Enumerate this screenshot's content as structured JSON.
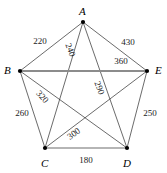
{
  "figure": {
    "type": "complete-graph-k5",
    "width": 167,
    "height": 173,
    "background_color": "#ffffff",
    "edge_color": "#2b2b2b",
    "highlight_edge_color": "#8c8c8c",
    "vertex_color": "#000000"
  },
  "vertices": [
    {
      "id": "A",
      "label": "A",
      "x": 83,
      "y": 22,
      "label_x": 79,
      "label_y": 6
    },
    {
      "id": "B",
      "label": "B",
      "x": 20,
      "y": 71,
      "label_x": 4,
      "label_y": 65
    },
    {
      "id": "C",
      "label": "C",
      "x": 45,
      "y": 148,
      "label_x": 41,
      "label_y": 158
    },
    {
      "id": "D",
      "label": "D",
      "x": 127,
      "y": 148,
      "label_x": 123,
      "label_y": 158
    },
    {
      "id": "E",
      "label": "E",
      "x": 147,
      "y": 71,
      "label_x": 155,
      "label_y": 65
    }
  ],
  "edges": [
    {
      "from": "A",
      "to": "B",
      "weight": "220",
      "kind": "perimeter",
      "label_x": 40,
      "label_y": 41,
      "rotation": 0
    },
    {
      "from": "A",
      "to": "E",
      "weight": "430",
      "kind": "perimeter",
      "label_x": 128,
      "label_y": 42,
      "rotation": 0
    },
    {
      "from": "B",
      "to": "C",
      "weight": "260",
      "kind": "perimeter",
      "label_x": 22,
      "label_y": 113,
      "rotation": 0
    },
    {
      "from": "D",
      "to": "E",
      "weight": "250",
      "kind": "perimeter",
      "label_x": 150,
      "label_y": 113,
      "rotation": 0
    },
    {
      "from": "C",
      "to": "D",
      "weight": "180",
      "kind": "perimeter",
      "label_x": 86,
      "label_y": 160,
      "rotation": 0
    },
    {
      "from": "A",
      "to": "C",
      "weight": "240",
      "kind": "diagonal",
      "label_x": 70,
      "label_y": 50,
      "rotation": 70
    },
    {
      "from": "A",
      "to": "D",
      "weight": "290",
      "kind": "diagonal",
      "label_x": 99,
      "label_y": 88,
      "rotation": 70
    },
    {
      "from": "B",
      "to": "D",
      "weight": "320",
      "kind": "diagonal",
      "label_x": 42,
      "label_y": 97,
      "rotation": 48
    },
    {
      "from": "B",
      "to": "E",
      "weight": "360",
      "kind": "highlight",
      "label_x": 121,
      "label_y": 61,
      "rotation": 0
    },
    {
      "from": "C",
      "to": "E",
      "weight": "300",
      "kind": "diagonal",
      "label_x": 74,
      "label_y": 134,
      "rotation": -37
    }
  ]
}
